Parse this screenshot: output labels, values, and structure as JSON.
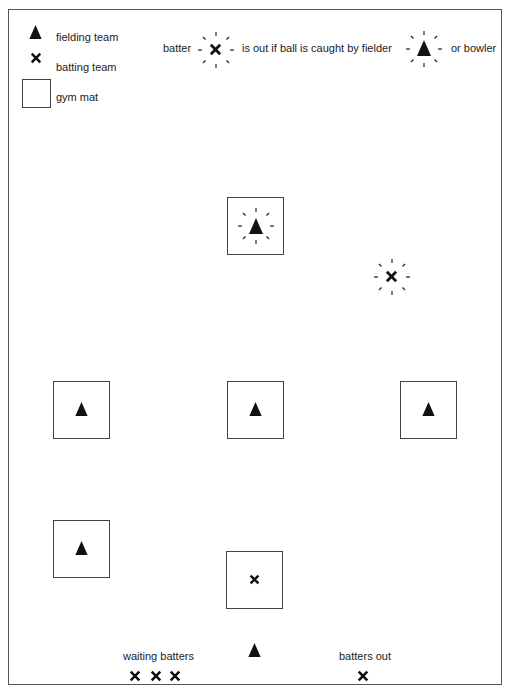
{
  "diagram": {
    "type": "game layout diagram",
    "legend": {
      "items": [
        {
          "icon": "triangle-icon",
          "label": "fielding team"
        },
        {
          "icon": "cross-icon",
          "label": "batting team"
        },
        {
          "icon": "square-icon",
          "label": "gym mat"
        }
      ]
    },
    "rule": {
      "batter_label": "batter",
      "middle_text": "is out if ball is caught by fielder",
      "end_text": "or bowler"
    },
    "field": {
      "mats": [
        {
          "id": "top-center",
          "occupant": "fielder-highlighted"
        },
        {
          "id": "middle-left",
          "occupant": "fielder"
        },
        {
          "id": "middle-center",
          "occupant": "fielder"
        },
        {
          "id": "middle-right",
          "occupant": "fielder"
        },
        {
          "id": "lower-left",
          "occupant": "fielder"
        },
        {
          "id": "bottom-center",
          "occupant": "batter"
        }
      ],
      "free_batter": "batter-highlighted",
      "bowler": "fielder"
    },
    "bottom": {
      "waiting_label": "waiting batters",
      "waiting_count": 3,
      "out_label": "batters out",
      "out_count": 1
    },
    "colors": {
      "ink": "#111111",
      "border": "#444444",
      "background": "#ffffff"
    }
  }
}
